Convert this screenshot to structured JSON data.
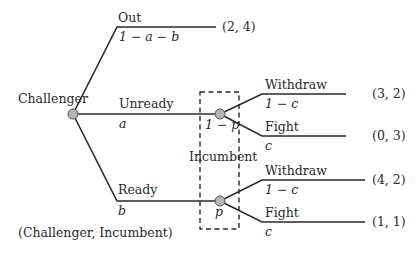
{
  "diagram": {
    "type": "game-tree",
    "root": {
      "player": "Challenger"
    },
    "branches": {
      "out": {
        "label": "Out",
        "prob": "1 − a − b",
        "payoff": "(2, 4)"
      },
      "unready": {
        "label": "Unready",
        "prob": "a"
      },
      "ready": {
        "label": "Ready",
        "prob": "b"
      }
    },
    "info_set": {
      "player": "Incumbent",
      "node_unready_prob": "1 − p",
      "node_ready_prob": "p"
    },
    "unready_node": {
      "withdraw": {
        "label": "Withdraw",
        "prob": "1 − c",
        "payoff": "(3, 2)"
      },
      "fight": {
        "label": "Fight",
        "prob": "c",
        "payoff": "(0, 3)"
      }
    },
    "ready_node": {
      "withdraw": {
        "label": "Withdraw",
        "prob": "1 − c",
        "payoff": "(4, 2)"
      },
      "fight": {
        "label": "Fight",
        "prob": "c",
        "payoff": "(1, 1)"
      }
    },
    "payoff_legend": "(Challenger, Incumbent)",
    "colors": {
      "line": "#2a2a2a",
      "node_fill": "#b5b5b5",
      "node_stroke": "#555555"
    }
  }
}
